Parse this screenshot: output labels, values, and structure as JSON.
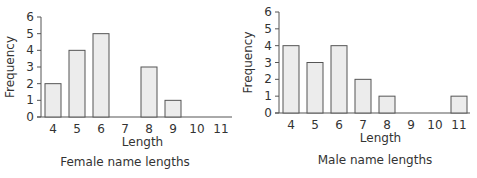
{
  "chart_data": [
    {
      "type": "bar",
      "title": "Female name lengths",
      "xlabel": "Length",
      "ylabel": "Frequency",
      "categories": [
        "4",
        "5",
        "6",
        "7",
        "8",
        "9",
        "10",
        "11"
      ],
      "values": [
        2,
        4,
        5,
        0,
        3,
        1,
        0,
        0
      ],
      "yticks": [
        "0",
        "1",
        "2",
        "3",
        "4",
        "5",
        "6"
      ],
      "ylim": [
        0,
        6
      ],
      "grid": false,
      "legend": null
    },
    {
      "type": "bar",
      "title": "Male name lengths",
      "xlabel": "Length",
      "ylabel": "Frequency",
      "categories": [
        "4",
        "5",
        "6",
        "7",
        "8",
        "9",
        "10",
        "11"
      ],
      "values": [
        4,
        3,
        4,
        2,
        1,
        0,
        0,
        1
      ],
      "yticks": [
        "0",
        "1",
        "2",
        "3",
        "4",
        "5",
        "6"
      ],
      "ylim": [
        0,
        6
      ],
      "grid": false,
      "legend": null
    }
  ],
  "colors": {
    "bar_fill": "#ececec",
    "bar_stroke": "#555555",
    "axis": "#555555",
    "text": "#333333"
  }
}
